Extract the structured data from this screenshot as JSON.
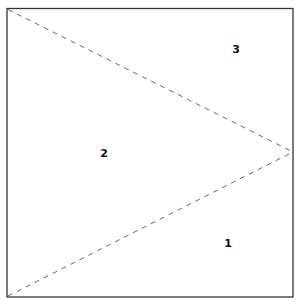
{
  "diagram": {
    "regions": [
      {
        "id": "1",
        "label": "1",
        "position": "bottom-right"
      },
      {
        "id": "2",
        "label": "2",
        "position": "left-center"
      },
      {
        "id": "3",
        "label": "3",
        "position": "top-right"
      }
    ],
    "colors": {
      "border": "#333333",
      "dashed_line": "#555555",
      "label": "#111111",
      "background": "#ffffff"
    }
  }
}
